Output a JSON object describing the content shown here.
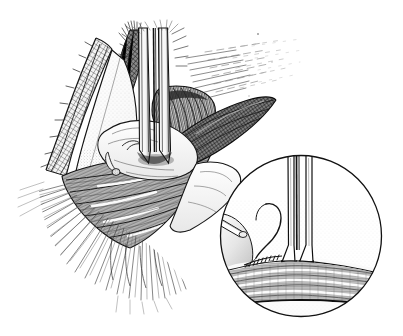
{
  "figure": {
    "domain": "medical-surgical-line-illustration",
    "width": 403,
    "height": 336,
    "background_color": "#ffffff",
    "ink_color": "#1a1a1a",
    "technique": "pen-and-ink stipple and cross-hatch line drawing",
    "caption": ""
  },
  "palette": {
    "paper": "#ffffff",
    "ink": "#1a1a1a",
    "ink_soft": "#555555",
    "ink_faint": "#9a9a9a",
    "tone_light": "#ededed",
    "tone_mid": "#cfcfcf",
    "tone_dark": "#8f8f8f",
    "tube_shade": "#3a3a3a"
  },
  "main_scene": {
    "name": "operative-field",
    "elements": [
      {
        "id": "skin-flap-left",
        "label": "Retracted skin flap (left)",
        "texture": "cross-hatch mesh dermal edge",
        "shade": "#d8d8d8"
      },
      {
        "id": "soft-tissue-bulge-left",
        "label": "Retracted soft tissue lobe",
        "texture": "fine stipple",
        "shade": "#dcdcdc"
      },
      {
        "id": "muscle-belly",
        "label": "Striated muscle belly",
        "texture": "parallel fiber striations",
        "shade": "#c2c2c2"
      },
      {
        "id": "fascia-fan-lower-left",
        "label": "Fascial plane (radiating hatch)",
        "texture": "radiating fan hatch",
        "shade": "#b5b5b5"
      },
      {
        "id": "retractor-blade-right",
        "label": "Dark retractor blade (right)",
        "texture": "dense cross-hatch",
        "shade": "#5a5a5a"
      },
      {
        "id": "retractor-blade-upper-left",
        "label": "Retractor blade (upper left)",
        "texture": "dense cross-hatch",
        "shade": "#6a6a6a"
      },
      {
        "id": "tracheal-rings",
        "label": "Ringed tubular structure (cartilage rings)",
        "texture": "arc striations",
        "shade": "#a8a8a8"
      },
      {
        "id": "tube-pair-main",
        "label": "Pair of parallel tube shafts entering the wound",
        "count": 2,
        "shade": "#ffffff",
        "edge": "#1a1a1a"
      },
      {
        "id": "hatch-fade-upper-right",
        "label": "Fading hatch lines (tissue falling away)",
        "texture": "broken parallel dashes",
        "shade": "#9a9a9a"
      }
    ]
  },
  "inset": {
    "name": "magnified-detail",
    "shape": "circle",
    "center_x": 301,
    "center_y": 236,
    "radius": 81,
    "border_color": "#1a1a1a",
    "border_width": 1,
    "fill": "#ffffff",
    "elements": [
      {
        "id": "inset-tube-left",
        "label": "Tube shaft (left) flaring at entry",
        "shade": "#ffffff"
      },
      {
        "id": "inset-tube-right",
        "label": "Tube shaft (right) flaring at entry",
        "shade": "#ffffff"
      },
      {
        "id": "inset-needle",
        "label": "Curved suture needle with thread",
        "shade": "#ffffff"
      },
      {
        "id": "inset-forceps",
        "label": "Instrument tip entering from the left",
        "shade": "#ffffff"
      },
      {
        "id": "inset-suture-row",
        "label": "Row of placed sutures / stitch marks",
        "stitch_count": 9
      },
      {
        "id": "inset-tissue-bands",
        "label": "Layered striated tissue bands below entry site",
        "band_count": 5,
        "shade": "#c8c8c8"
      },
      {
        "id": "inset-basal-line",
        "label": "Dark basal boundary line",
        "shade": "#1a1a1a"
      }
    ]
  }
}
